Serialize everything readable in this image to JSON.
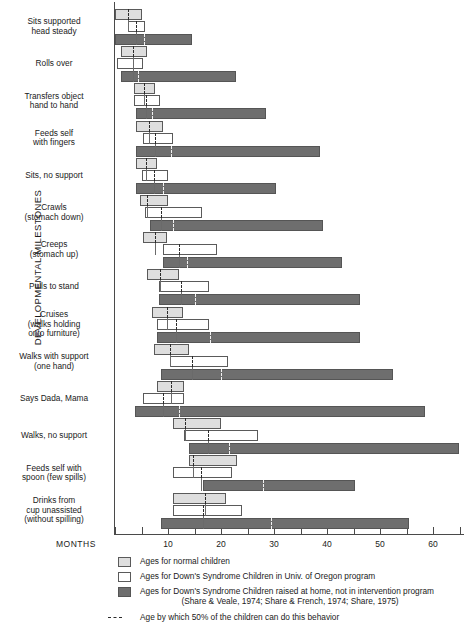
{
  "axis": {
    "y_title": "DEVELOPMENTAL MILESTONES",
    "x_unit_label": "MONTHS",
    "x_tick_labels": [
      "10",
      "20",
      "30",
      "40",
      "50",
      "60"
    ]
  },
  "legend": {
    "items": [
      {
        "swatch": "normal",
        "label": "Ages for normal children"
      },
      {
        "swatch": "oregon",
        "label": "Ages for Down's Syndrome Children in Univ. of Oregon program"
      },
      {
        "swatch": "home",
        "label": "Ages for Down's Syndrome Children raised at home, not in intervention program"
      }
    ],
    "citation": "(Share & Veale, 1974; Share & French, 1974; Share, 1975)",
    "median_note": "Age by which 50% of the children can do this behavior"
  },
  "chart_data": {
    "type": "bar",
    "title": "",
    "xlabel": "MONTHS",
    "ylabel": "DEVELOPMENTAL MILESTONES",
    "xlim": [
      0,
      66
    ],
    "xticks": [
      0,
      5,
      10,
      15,
      20,
      25,
      30,
      35,
      40,
      45,
      50,
      55,
      60,
      65
    ],
    "xtick_labels": [
      "",
      "",
      "10",
      "",
      "20",
      "",
      "30",
      "",
      "40",
      "",
      "50",
      "",
      "60",
      ""
    ],
    "grid": false,
    "orientation": "horizontal-range",
    "note": "Each milestone shows three age-range bars (min to max months); dashed tick marks the median age at which 50% of children achieve the behavior.",
    "series": [
      {
        "name": "Ages for normal children",
        "key": "normal",
        "color": "#dedede"
      },
      {
        "name": "Ages for Down's Syndrome Children in Univ. of Oregon program",
        "key": "oregon",
        "color": "#ffffff"
      },
      {
        "name": "Ages for Down's Syndrome Children raised at home, not in intervention program",
        "key": "home",
        "color": "#6e6e6e"
      }
    ],
    "categories": [
      "Sits supported head steady",
      "Rolls over",
      "Transfers object hand to hand",
      "Feeds self with fingers",
      "Sits, no support",
      "Crawls (stomach down)",
      "Creeps (stomach up)",
      "Pulls to stand",
      "Cruises (walks holding onto furniture)",
      "Walks with support (one hand)",
      "Says Dada, Mama",
      "Walks, no support",
      "Feeds self with spoon (few spills)",
      "Drinks from cup unassisted (without spilling)"
    ],
    "rows": [
      {
        "label_lines": [
          "Sits supported",
          "head steady"
        ],
        "normal": {
          "start": 0.0,
          "end": 5.0,
          "median": 2.4
        },
        "oregon": {
          "start": 2.4,
          "end": 5.7,
          "median": 4.0
        },
        "home": {
          "start": 0.0,
          "end": 14.5,
          "median": 5.5
        }
      },
      {
        "label_lines": [
          "Rolls over"
        ],
        "normal": {
          "start": 1.1,
          "end": 6.0,
          "median": 3.4
        },
        "oregon": {
          "start": 0.4,
          "end": 5.3,
          "median": 3.4
        },
        "home": {
          "start": 1.1,
          "end": 22.8,
          "median": 4.3
        }
      },
      {
        "label_lines": [
          "Transfers object",
          "hand to hand"
        ],
        "normal": {
          "start": 3.6,
          "end": 7.6,
          "median": 5.5
        },
        "oregon": {
          "start": 3.6,
          "end": 8.5,
          "median": 5.8
        },
        "home": {
          "start": 4.0,
          "end": 28.5,
          "median": 7.0
        }
      },
      {
        "label_lines": [
          "Feeds self",
          "with fingers"
        ],
        "normal": {
          "start": 4.0,
          "end": 9.0,
          "median": 6.4
        },
        "oregon": {
          "start": 5.3,
          "end": 11.0,
          "median": 7.5
        },
        "home": {
          "start": 4.0,
          "end": 38.7,
          "median": 10.5
        }
      },
      {
        "label_lines": [
          "Sits, no support"
        ],
        "normal": {
          "start": 4.0,
          "end": 8.0,
          "median": 5.8
        },
        "oregon": {
          "start": 5.1,
          "end": 10.0,
          "median": 7.4
        },
        "home": {
          "start": 4.0,
          "end": 30.4,
          "median": 9.0
        }
      },
      {
        "label_lines": [
          "Crawls",
          "(stomach down)"
        ],
        "normal": {
          "start": 4.7,
          "end": 10.0,
          "median": 6.0
        },
        "oregon": {
          "start": 5.7,
          "end": 16.4,
          "median": 8.7
        },
        "home": {
          "start": 6.6,
          "end": 39.2,
          "median": 11.0
        }
      },
      {
        "label_lines": [
          "Creeps",
          "(stomach up)"
        ],
        "normal": {
          "start": 5.3,
          "end": 9.8,
          "median": 7.5
        },
        "oregon": {
          "start": 9.0,
          "end": 19.2,
          "median": 12.0
        },
        "home": {
          "start": 9.0,
          "end": 42.9,
          "median": 13.5
        }
      },
      {
        "label_lines": [
          "Pulls to stand"
        ],
        "normal": {
          "start": 6.0,
          "end": 12.0,
          "median": 8.5
        },
        "oregon": {
          "start": 8.3,
          "end": 17.7,
          "median": 12.5
        },
        "home": {
          "start": 8.3,
          "end": 46.2,
          "median": 15.0
        }
      },
      {
        "label_lines": [
          "Cruises",
          "(walks holding",
          "onto furniture)"
        ],
        "normal": {
          "start": 7.0,
          "end": 12.8,
          "median": 9.8
        },
        "oregon": {
          "start": 7.9,
          "end": 17.7,
          "median": 11.5
        },
        "home": {
          "start": 7.9,
          "end": 46.2,
          "median": 18.0
        }
      },
      {
        "label_lines": [
          "Walks with support",
          "(one hand)"
        ],
        "normal": {
          "start": 7.4,
          "end": 13.9,
          "median": 10.4
        },
        "oregon": {
          "start": 10.4,
          "end": 21.3,
          "median": 14.5
        },
        "home": {
          "start": 8.7,
          "end": 52.5,
          "median": 20.0
        }
      },
      {
        "label_lines": [
          "Says Dada, Mama"
        ],
        "normal": {
          "start": 8.0,
          "end": 13.0,
          "median": 10.5
        },
        "oregon": {
          "start": 5.3,
          "end": 13.0,
          "median": 9.0
        },
        "home": {
          "start": 3.8,
          "end": 58.5,
          "median": 12.0
        }
      },
      {
        "label_lines": [
          "Walks, no support"
        ],
        "normal": {
          "start": 11.0,
          "end": 20.0,
          "median": 13.2
        },
        "oregon": {
          "start": 13.0,
          "end": 27.0,
          "median": 17.5
        },
        "home": {
          "start": 13.9,
          "end": 65.0,
          "median": 21.5
        }
      },
      {
        "label_lines": [
          "Feeds self with",
          "spoon (few spills)"
        ],
        "normal": {
          "start": 13.9,
          "end": 23.0,
          "median": 14.7
        },
        "oregon": {
          "start": 10.9,
          "end": 22.0,
          "median": 16.2
        },
        "home": {
          "start": 16.6,
          "end": 45.3,
          "median": 28.0
        }
      },
      {
        "label_lines": [
          "Drinks from",
          "cup unassisted",
          "(without spilling)"
        ],
        "normal": {
          "start": 10.9,
          "end": 21.0,
          "median": 17.0
        },
        "oregon": {
          "start": 10.9,
          "end": 24.0,
          "median": 16.6
        },
        "home": {
          "start": 8.7,
          "end": 55.5,
          "median": 29.5
        }
      }
    ]
  }
}
